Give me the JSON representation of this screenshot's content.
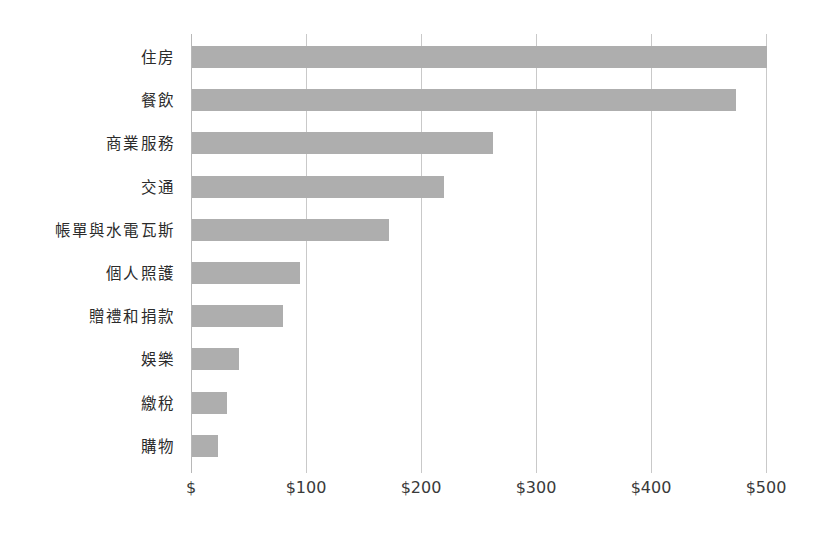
{
  "chart_data": {
    "type": "bar",
    "orientation": "horizontal",
    "title": "",
    "subtitle": "",
    "xlabel": "",
    "ylabel": "",
    "categories": [
      "住房",
      "餐飲",
      "商業服務",
      "交通",
      "帳單與水電瓦斯",
      "個人照護",
      "贈禮和捐款",
      "娛樂",
      "繳稅",
      "購物"
    ],
    "values": [
      500,
      473,
      262,
      219,
      171,
      94,
      79,
      41,
      30,
      23
    ],
    "series": [
      {
        "name": "",
        "values": [
          500,
          473,
          262,
          219,
          171,
          94,
          79,
          41,
          30,
          23
        ]
      }
    ],
    "xlim": [
      0,
      500
    ],
    "xticks": [
      0,
      100,
      200,
      300,
      400,
      500
    ],
    "xtick_labels": [
      "$",
      "$100",
      "$200",
      "$300",
      "$400",
      "$500"
    ],
    "grid": "vertical",
    "legend": "none",
    "bar_color": "#aeaeae",
    "gridline_color": "#c9c9c9",
    "axis_color": "#b8b8b8",
    "label_color": "#2b2b2b",
    "background": "#ffffff"
  }
}
